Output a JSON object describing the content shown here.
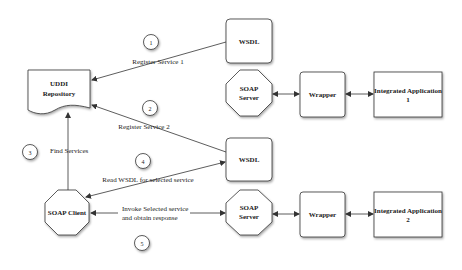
{
  "diagram": {
    "nodes": {
      "uddi": {
        "line1": "UDDI",
        "line2": "Repository"
      },
      "wsdl_top": {
        "label": "WSDL"
      },
      "soap_server_top": {
        "line1": "SOAP",
        "line2": "Server"
      },
      "wrapper_top": {
        "label": "Wrapper"
      },
      "app1": {
        "line1": "Integrated Application",
        "line2": "1"
      },
      "wsdl_bottom": {
        "label": "WSDL"
      },
      "soap_client": {
        "label": "SOAP Client"
      },
      "soap_server_bottom": {
        "line1": "SOAP",
        "line2": "Server"
      },
      "wrapper_bottom": {
        "label": "Wrapper"
      },
      "app2": {
        "line1": "Integrated Application",
        "line2": "2"
      }
    },
    "steps": [
      {
        "number": "1",
        "label": "Register Service 1"
      },
      {
        "number": "2",
        "label": "Register Service 2"
      },
      {
        "number": "3",
        "label": "Find Services"
      },
      {
        "number": "4",
        "label": "Read WSDL for selected service"
      },
      {
        "number": "5",
        "line1": "Invoke Selected service",
        "line2": "and obtain response"
      }
    ]
  }
}
